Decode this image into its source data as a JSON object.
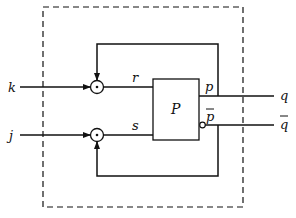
{
  "diagram": {
    "type": "block-diagram",
    "boundary": "dashed enclosure",
    "block": {
      "label": "P"
    },
    "inputs": [
      {
        "label": "k",
        "internal": "r"
      },
      {
        "label": "j",
        "internal": "s"
      }
    ],
    "outputs": [
      {
        "internal": "p",
        "external": "q"
      },
      {
        "internal": "p̄",
        "external": "q̄",
        "inverted": true
      }
    ],
    "junction_symbol": "⊙",
    "feedback": [
      {
        "from": "p",
        "to": "k-junction"
      },
      {
        "from": "p̄",
        "to": "j-junction"
      }
    ],
    "colors": {
      "stroke": "#111111",
      "background": "#ffffff"
    }
  }
}
